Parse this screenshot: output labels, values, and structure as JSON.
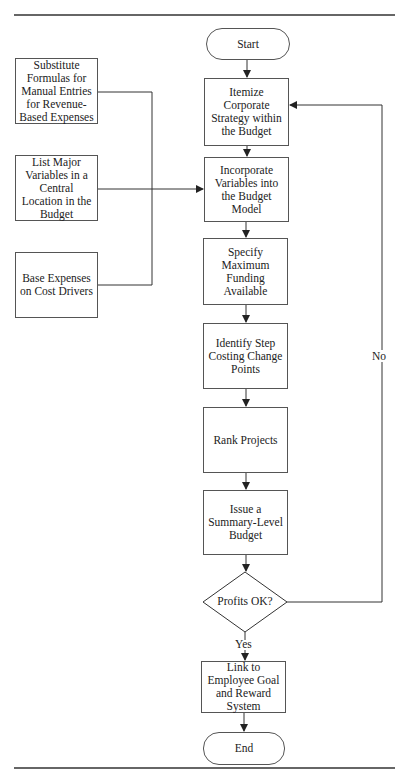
{
  "flowchart": {
    "start": "Start",
    "end": "End",
    "steps": [
      "Itemize Corporate Strategy within the Budget",
      "Incorporate Variables into the Budget Model",
      "Specify Maximum Funding Available",
      "Identify Step Costing Change Points",
      "Rank Projects",
      "Issue a Summary-Level Budget"
    ],
    "decision": "Profits OK?",
    "yes_label": "Yes",
    "no_label": "No",
    "final_step": "Link to Employee Goal and Reward System",
    "inputs": [
      "Substitute Formulas for Manual Entries for Revenue-Based Expenses",
      "List Major Variables in a Central Location in the Budget",
      "Base Expenses on Cost Drivers"
    ]
  }
}
